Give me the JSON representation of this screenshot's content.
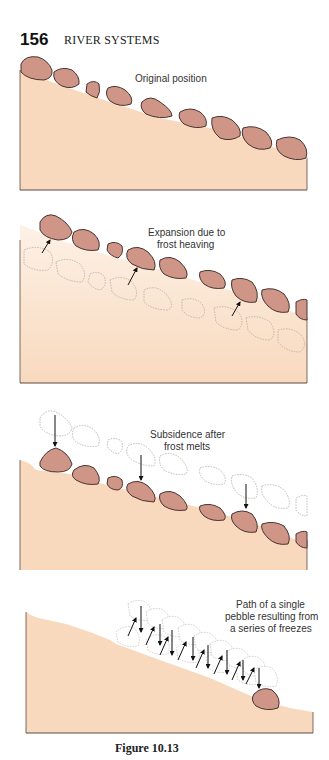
{
  "header": {
    "page_number": "156",
    "running_head": "RIVER SYSTEMS"
  },
  "figure": {
    "caption": "Figure 10.13",
    "colors": {
      "soil": "#f8d9bd",
      "soil_light": "#fbe8d8",
      "pebble_fill": "#cf9688",
      "pebble_stroke": "#4a3430",
      "ghost_stroke": "#b0a8a2",
      "arrow": "#111111"
    },
    "panels": [
      {
        "id": "original",
        "label_lines": [
          "Original position"
        ]
      },
      {
        "id": "expansion",
        "label_lines": [
          "Expansion due to",
          "frost heaving"
        ]
      },
      {
        "id": "subsidence",
        "label_lines": [
          "Subsidence after",
          "frost melts"
        ]
      },
      {
        "id": "path",
        "label_lines": [
          "Path of a single",
          "pebble resulting from",
          "a series of freezes"
        ]
      }
    ]
  }
}
